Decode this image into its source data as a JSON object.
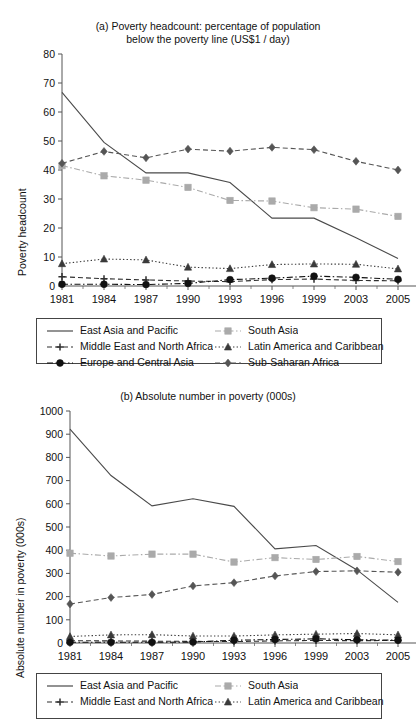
{
  "figure": {
    "background": "#ffffff",
    "series_colors": {
      "east_asia": "#4a4a4a",
      "middle_east": "#2f2f2f",
      "europe": "#111111",
      "south_asia": "#aaaaaa",
      "latin_america": "#3a3a3a",
      "sub_saharan": "#555555"
    }
  },
  "legend": {
    "items": [
      {
        "label": "East Asia and Pacific",
        "key": "solid-line-key",
        "color": "#4a4a4a",
        "dash": "none",
        "marker": "none"
      },
      {
        "label": "South Asia",
        "key": "dash-dot-square-key",
        "color": "#aaaaaa",
        "dash": "dashdot",
        "marker": "square"
      },
      {
        "label": "Middle East and North Africa",
        "key": "dashed-plus-key",
        "color": "#2f2f2f",
        "dash": "dashed",
        "marker": "plus"
      },
      {
        "label": "Latin America and Caribbean",
        "key": "dotted-triangle-key",
        "color": "#3a3a3a",
        "dash": "dotted",
        "marker": "triangle"
      },
      {
        "label": "Europe and Central Asia",
        "key": "dashdot-circle-key",
        "color": "#111111",
        "dash": "dashdot",
        "marker": "circle"
      },
      {
        "label": "Sub-Saharan Africa",
        "key": "dotted-diamond-key",
        "color": "#555555",
        "dash": "dashed",
        "marker": "diamond"
      }
    ]
  },
  "chart_data": [
    {
      "id": "chart-a",
      "type": "line",
      "title": "(a) Poverty headcount: percentage of population below the poverty line (US$1 / day)",
      "title_line1": "(a) Poverty headcount: percentage of population",
      "title_line2": "below the poverty line (US$1 / day)",
      "xlabel": "",
      "ylabel": "Poverty headcount",
      "categories": [
        "1981",
        "1984",
        "1987",
        "1990",
        "1993",
        "1996",
        "1999",
        "2003",
        "2005"
      ],
      "ylim": [
        0,
        80
      ],
      "yticks": [
        0,
        10,
        20,
        30,
        40,
        50,
        60,
        70,
        80
      ],
      "grid": false,
      "legend_position": "below",
      "series": [
        {
          "name": "East Asia and Pacific",
          "marker": "none",
          "dash": "none",
          "color": "#4a4a4a",
          "values": [
            66.8,
            49.5,
            39.0,
            39.0,
            35.7,
            23.4,
            23.4,
            16.6,
            9.5
          ]
        },
        {
          "name": "South Asia",
          "marker": "square",
          "dash": "dashdot",
          "color": "#aaaaaa",
          "values": [
            41.5,
            38.0,
            36.5,
            34.0,
            29.5,
            29.3,
            27.0,
            26.5,
            24.0
          ]
        },
        {
          "name": "Middle East and North Africa",
          "marker": "plus",
          "dash": "dashed",
          "color": "#2f2f2f",
          "values": [
            3.2,
            2.5,
            2.1,
            1.7,
            1.5,
            2.2,
            2.4,
            1.9,
            1.8
          ]
        },
        {
          "name": "Latin America and Caribbean",
          "marker": "triangle",
          "dash": "dotted",
          "color": "#3a3a3a",
          "values": [
            7.7,
            9.3,
            9.0,
            6.5,
            6.0,
            7.4,
            7.6,
            7.5,
            5.9
          ]
        },
        {
          "name": "Europe and Central Asia",
          "marker": "circle",
          "dash": "dashdot",
          "color": "#111111",
          "values": [
            0.6,
            0.6,
            0.5,
            0.9,
            2.2,
            2.7,
            3.4,
            3.0,
            2.3
          ]
        },
        {
          "name": "Sub-Saharan Africa",
          "marker": "diamond",
          "dash": "dashed",
          "color": "#555555",
          "values": [
            42.3,
            46.4,
            44.2,
            47.2,
            46.5,
            47.8,
            47.0,
            43.0,
            40.0
          ]
        }
      ]
    },
    {
      "id": "chart-b",
      "type": "line",
      "title": "(b) Absolute number in poverty (000s)",
      "xlabel": "",
      "ylabel": "Absolute number in poverty (000s)",
      "categories": [
        "1981",
        "1984",
        "1987",
        "1990",
        "1993",
        "1996",
        "1999",
        "2003",
        "2005"
      ],
      "ylim": [
        0,
        1000
      ],
      "yticks": [
        0,
        100,
        200,
        300,
        400,
        500,
        600,
        700,
        800,
        900,
        1000
      ],
      "grid": false,
      "legend_position": "below",
      "series": [
        {
          "name": "East Asia and Pacific",
          "marker": "none",
          "dash": "none",
          "color": "#4a4a4a",
          "values": [
            922,
            722,
            591,
            622,
            589,
            406,
            420,
            315,
            175
          ]
        },
        {
          "name": "South Asia",
          "marker": "square",
          "dash": "dashdot",
          "color": "#aaaaaa",
          "values": [
            387,
            375,
            383,
            383,
            349,
            368,
            360,
            373,
            351
          ]
        },
        {
          "name": "Middle East and North Africa",
          "marker": "plus",
          "dash": "dashed",
          "color": "#2f2f2f",
          "values": [
            10,
            9,
            8,
            7,
            6,
            9,
            11,
            10,
            11
          ]
        },
        {
          "name": "Latin America and Caribbean",
          "marker": "triangle",
          "dash": "dotted",
          "color": "#3a3a3a",
          "values": [
            28,
            35,
            36,
            30,
            30,
            35,
            38,
            41,
            35
          ]
        },
        {
          "name": "Europe and Central Asia",
          "marker": "circle",
          "dash": "dashdot",
          "color": "#111111",
          "values": [
            3,
            3,
            3,
            4,
            12,
            15,
            18,
            14,
            12
          ]
        },
        {
          "name": "Sub-Saharan Africa",
          "marker": "diamond",
          "dash": "dashed",
          "color": "#555555",
          "values": [
            168,
            196,
            209,
            246,
            260,
            289,
            308,
            311,
            305
          ]
        }
      ]
    }
  ]
}
